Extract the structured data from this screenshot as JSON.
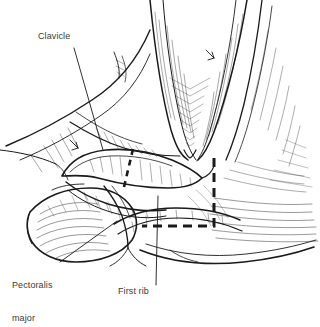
{
  "figure": {
    "background_color": "#ffffff",
    "ink_color": "#1a1a1a",
    "label_color": "#3a3a3a",
    "width": 320,
    "height": 321
  },
  "labels": [
    {
      "id": "clavicle",
      "text": "Clavicle",
      "x": 38,
      "y": 36,
      "leader": {
        "from": [
          74,
          48
        ],
        "to": [
          103,
          150
        ]
      }
    },
    {
      "id": "pectoralis-major",
      "text": "Pectoralis\nmajor",
      "line1": "Pectoralis",
      "line2": "major",
      "x": 12,
      "y": 262,
      "leader": {
        "from": [
          60,
          262
        ],
        "to": [
          117,
          221
        ]
      }
    },
    {
      "id": "first-rib",
      "text": "First rib",
      "x": 118,
      "y": 290,
      "leader": {
        "from": [
          156,
          285
        ],
        "to": [
          158,
          196
        ]
      }
    }
  ],
  "incision": {
    "name": "dashed-incision-line",
    "style": "dashed",
    "description": "L-shaped dashed incision from sternal notch down and laterally",
    "color": "#1a1a1a",
    "vertical": {
      "x": 214,
      "y1": 158,
      "y2": 226
    },
    "horizontal": {
      "y": 226,
      "x1": 142,
      "x2": 214
    }
  },
  "osteotomy": {
    "name": "clavicle-osteotomy-dashes",
    "description": "Dashed transection line across the clavicle",
    "from": [
      132,
      150
    ],
    "to": [
      124,
      186
    ]
  },
  "structures": [
    {
      "name": "clavicle-bone"
    },
    {
      "name": "first-rib-bone"
    },
    {
      "name": "pectoralis-major-muscle"
    },
    {
      "name": "sternocleidomastoid-muscle"
    },
    {
      "name": "sternal-notch"
    },
    {
      "name": "subclavian-vessels"
    },
    {
      "name": "chest-wall"
    },
    {
      "name": "skin-flap"
    }
  ]
}
